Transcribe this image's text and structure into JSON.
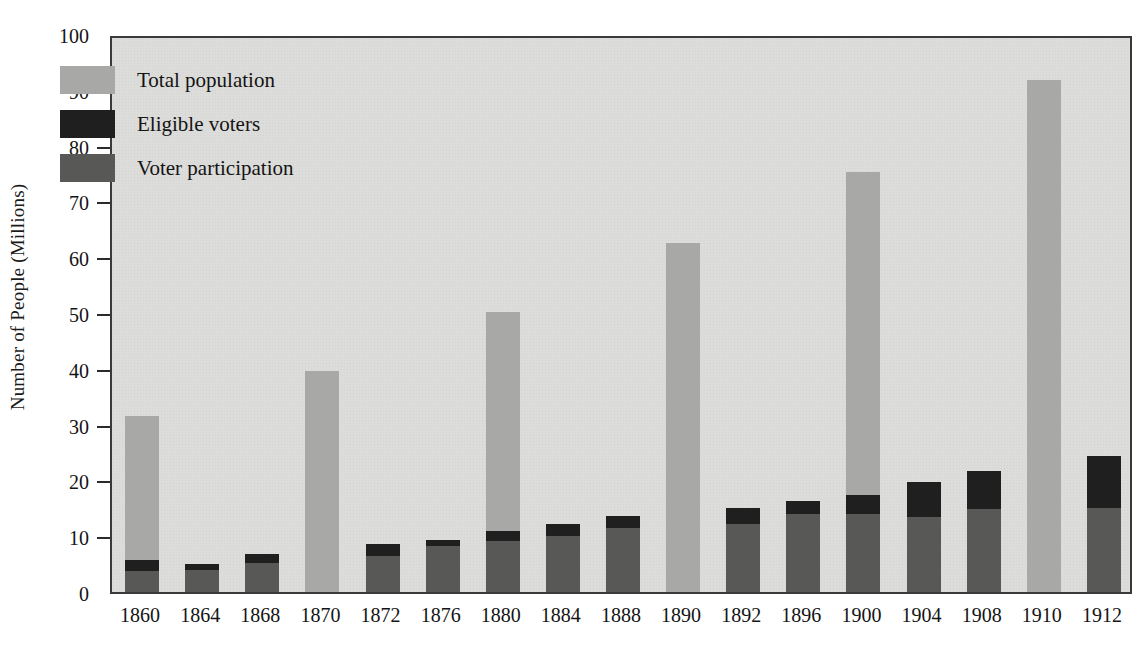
{
  "chart_data": {
    "type": "bar",
    "subtype": "stacked-overlay",
    "title": "",
    "xlabel": "",
    "ylabel": "Number of People (Millions)",
    "ylim": [
      0,
      100
    ],
    "yticks": [
      0,
      10,
      20,
      30,
      40,
      50,
      60,
      70,
      80,
      90,
      100
    ],
    "grid": false,
    "legend_position": "upper-left",
    "categories": [
      "1860",
      "1864",
      "1868",
      "1870",
      "1872",
      "1876",
      "1880",
      "1884",
      "1888",
      "1890",
      "1892",
      "1896",
      "1900",
      "1904",
      "1908",
      "1910",
      "1912"
    ],
    "series": [
      {
        "name": "Total population",
        "color": "#a8a8a6",
        "values": [
          31.5,
          null,
          null,
          39.6,
          null,
          null,
          50.1,
          null,
          null,
          62.5,
          null,
          null,
          75.2,
          null,
          null,
          91.8,
          null
        ]
      },
      {
        "name": "Eligible voters",
        "color": "#201f1f",
        "values": [
          5.8,
          5.1,
          6.9,
          null,
          8.6,
          9.4,
          10.9,
          12.2,
          13.7,
          null,
          15.0,
          16.4,
          17.3,
          19.7,
          21.6,
          null,
          24.4
        ]
      },
      {
        "name": "Voter participation",
        "color": "#585857",
        "values": [
          3.8,
          4.0,
          5.2,
          null,
          6.5,
          8.2,
          9.2,
          10.0,
          11.4,
          null,
          12.1,
          13.9,
          13.9,
          13.5,
          14.9,
          null,
          15.0
        ]
      }
    ]
  },
  "y_axis": {
    "title": "Number of People (Millions)",
    "ticks": [
      {
        "value": 100,
        "label": "100",
        "show_mark": false
      },
      {
        "value": 90,
        "label": "90",
        "show_mark": true
      },
      {
        "value": 80,
        "label": "80",
        "show_mark": true
      },
      {
        "value": 70,
        "label": "70",
        "show_mark": true
      },
      {
        "value": 60,
        "label": "60",
        "show_mark": true
      },
      {
        "value": 50,
        "label": "50",
        "show_mark": true
      },
      {
        "value": 40,
        "label": "40",
        "show_mark": true
      },
      {
        "value": 30,
        "label": "30",
        "show_mark": true
      },
      {
        "value": 20,
        "label": "20",
        "show_mark": true
      },
      {
        "value": 10,
        "label": "10",
        "show_mark": true
      },
      {
        "value": 0,
        "label": "0",
        "show_mark": false
      }
    ]
  },
  "legend": {
    "items": [
      {
        "key": "total",
        "label": "Total population",
        "color": "#a8a8a6"
      },
      {
        "key": "eligible",
        "label": "Eligible voters",
        "color": "#201f1f"
      },
      {
        "key": "participation",
        "label": "Voter participation",
        "color": "#585857"
      }
    ]
  },
  "colors": {
    "plot_background": "#dcdcda",
    "axis": "#3a3a3a",
    "text": "#141414",
    "total_population": "#a8a8a6",
    "eligible_voters": "#201f1f",
    "voter_participation": "#585857"
  }
}
